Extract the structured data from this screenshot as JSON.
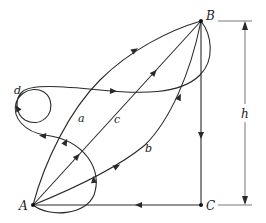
{
  "diagram": {
    "type": "path-independence work diagram",
    "points": {
      "A": {
        "label": "A",
        "x": 33,
        "y": 205
      },
      "B": {
        "label": "B",
        "x": 201,
        "y": 21
      },
      "C": {
        "label": "C",
        "x": 201,
        "y": 205
      }
    },
    "paths": [
      {
        "id": "a",
        "label": "a",
        "from": "A",
        "to": "B",
        "shape": "curve arcing upper-left"
      },
      {
        "id": "b",
        "label": "b",
        "from": "A",
        "to": "B",
        "shape": "curve arcing lower-right"
      },
      {
        "id": "c",
        "label": "c",
        "from": "A",
        "to": "B",
        "shape": "straight line"
      },
      {
        "id": "d",
        "label": "d",
        "from": "A",
        "to": "B",
        "shape": "looping curve"
      },
      {
        "id": "BC",
        "label": "",
        "from": "B",
        "to": "C",
        "shape": "vertical line"
      },
      {
        "id": "CA",
        "label": "",
        "from": "C",
        "to": "A",
        "shape": "horizontal line"
      }
    ],
    "dimension": {
      "label": "h",
      "description": "vertical height between B and C"
    },
    "colors": {
      "line": "#2a2a2a",
      "dimension": "#555555",
      "background": "#ffffff"
    }
  }
}
